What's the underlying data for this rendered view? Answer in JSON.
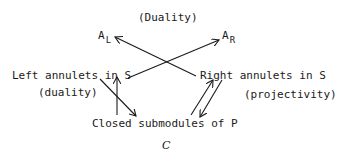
{
  "diagram": {
    "top_label": "(Duality)",
    "nodes": {
      "a_left": {
        "base": "A",
        "sub": "L"
      },
      "a_right": {
        "base": "A",
        "sub": "R"
      },
      "left_annulets": "Left annulets in S",
      "right_annulets": "Right annulets in S",
      "closed_submodules": "Closed submodules of P",
      "bottom_symbol": "C"
    },
    "edge_labels": {
      "left": "(duality)",
      "right": "(projectivity)"
    },
    "edges": [
      {
        "from": "left_annulets",
        "to": "a_right"
      },
      {
        "from": "right_annulets",
        "to": "a_left"
      },
      {
        "from": "closed_submodules",
        "to": "left_annulets"
      },
      {
        "from": "left_annulets",
        "to": "closed_submodules"
      },
      {
        "from": "closed_submodules",
        "to": "right_annulets"
      },
      {
        "from": "right_annulets",
        "to": "closed_submodules"
      }
    ],
    "colors": {
      "ink": "#1a1a1a",
      "background": "#ffffff"
    }
  }
}
